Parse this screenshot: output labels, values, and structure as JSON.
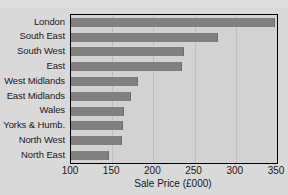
{
  "chart_data": {
    "type": "bar",
    "orientation": "horizontal",
    "title": "",
    "xlabel": "Sale Price (£000)",
    "ylabel": "",
    "xlim": [
      100,
      350
    ],
    "xticks": [
      100,
      150,
      200,
      250,
      300,
      350
    ],
    "grid": true,
    "legend": null,
    "categories": [
      "London",
      "South East",
      "South West",
      "East",
      "West Midlands",
      "East Midlands",
      "Wales",
      "Yorks & Humb.",
      "North West",
      "North East"
    ],
    "values": [
      348,
      278,
      237,
      235,
      181,
      173,
      164,
      163,
      162,
      146
    ]
  },
  "style": {
    "bar_color": "#808080",
    "plot_background": "#d2d2d2",
    "page_background": "#d9d9d9",
    "axis_color": "#000000",
    "gridline_color": "#bfbfbf",
    "text_color": "#1a1a1a"
  }
}
